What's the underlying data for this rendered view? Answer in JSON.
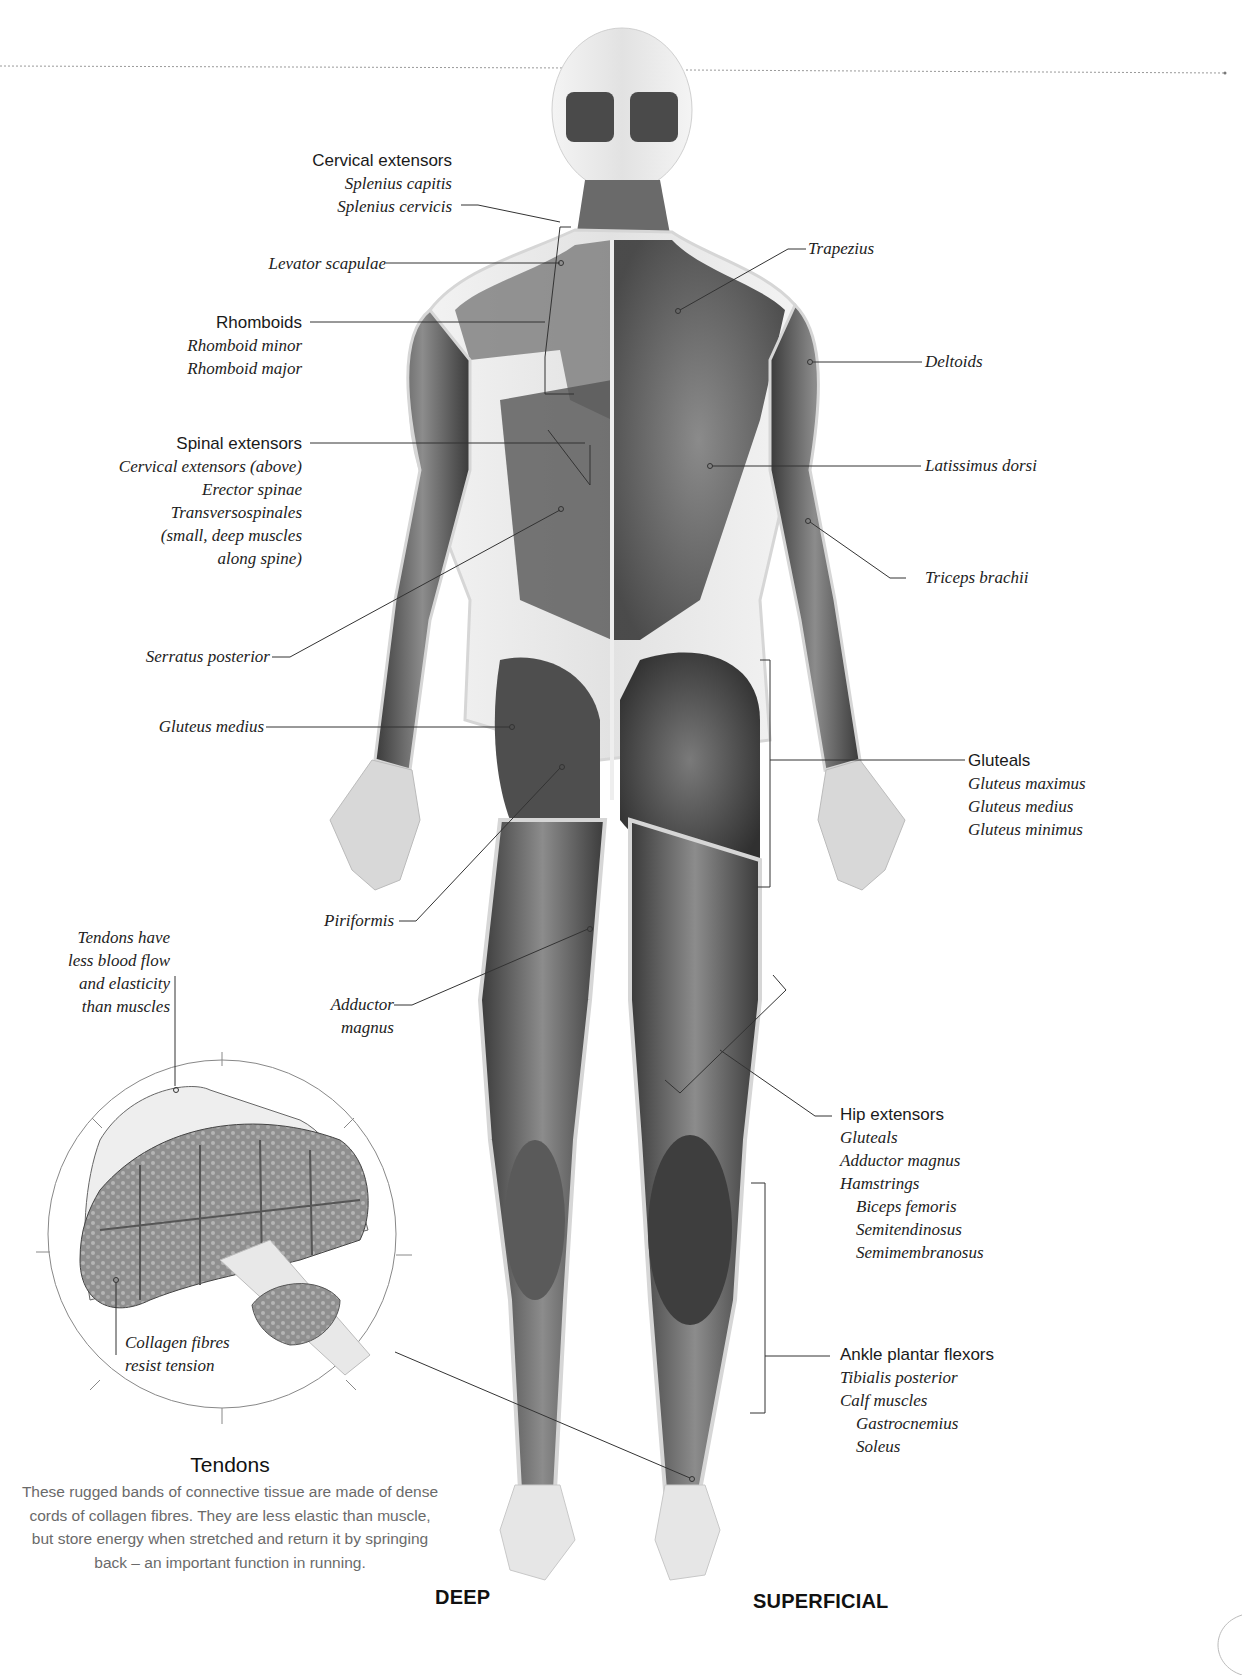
{
  "figure": {
    "view_labels": {
      "left": "DEEP",
      "right": "SUPERFICIAL"
    },
    "left_labels": [
      {
        "id": "cervical-extensors",
        "heading": "Cervical extensors",
        "items": [
          "Splenius capitis",
          "Splenius cervicis"
        ]
      },
      {
        "id": "levator-scapulae",
        "heading": "",
        "items": [
          "Levator scapulae"
        ]
      },
      {
        "id": "rhomboids",
        "heading": "Rhomboids",
        "items": [
          "Rhomboid minor",
          "Rhomboid major"
        ]
      },
      {
        "id": "spinal-extensors",
        "heading": "Spinal extensors",
        "items": [
          "Cervical extensors (above)",
          "Erector spinae",
          "Transversospinales",
          "(small, deep muscles",
          "along spine)"
        ]
      },
      {
        "id": "serratus-posterior",
        "heading": "",
        "items": [
          "Serratus posterior"
        ]
      },
      {
        "id": "gluteus-medius",
        "heading": "",
        "items": [
          "Gluteus medius"
        ]
      },
      {
        "id": "piriformis",
        "heading": "",
        "items": [
          "Piriformis"
        ]
      },
      {
        "id": "adductor-magnus",
        "heading": "",
        "items": [
          "Adductor",
          "magnus"
        ]
      }
    ],
    "right_labels": [
      {
        "id": "trapezius",
        "heading": "",
        "items": [
          "Trapezius"
        ]
      },
      {
        "id": "deltoids",
        "heading": "",
        "items": [
          "Deltoids"
        ]
      },
      {
        "id": "latissimus-dorsi",
        "heading": "",
        "items": [
          "Latissimus dorsi"
        ]
      },
      {
        "id": "triceps-brachii",
        "heading": "",
        "items": [
          "Triceps brachii"
        ]
      },
      {
        "id": "gluteals",
        "heading": "Gluteals",
        "items": [
          "Gluteus maximus",
          "Gluteus medius",
          "Gluteus minimus"
        ]
      },
      {
        "id": "hip-extensors",
        "heading": "Hip extensors",
        "items": [
          "Gluteals",
          "Adductor magnus",
          "Hamstrings"
        ],
        "sub_items": [
          "Biceps femoris",
          "Semitendinosus",
          "Semimembranosus"
        ]
      },
      {
        "id": "ankle-plantar-flexors",
        "heading": "Ankle plantar flexors",
        "items": [
          "Tibialis posterior",
          "Calf muscles"
        ],
        "sub_items": [
          "Gastrocnemius",
          "Soleus"
        ]
      }
    ]
  },
  "tendon_inset": {
    "callout_top": [
      "Tendons have",
      "less blood flow",
      "and elasticity",
      "than muscles"
    ],
    "callout_bottom": [
      "Collagen fibres",
      "resist tension"
    ],
    "title": "Tendons",
    "body": "These rugged bands of connective tissue are made of dense cords of collagen fibres. They are less elastic than muscle, but store energy when stretched and return it by springing back – an important function in running."
  },
  "colors": {
    "text": "#1a1a1a",
    "body_text": "#6a6a6a",
    "leader_line": "#333333",
    "muscle_dark": "#3c3c3c",
    "muscle_mid": "#8a8a8a",
    "skin_outline": "#d9d9d9"
  }
}
